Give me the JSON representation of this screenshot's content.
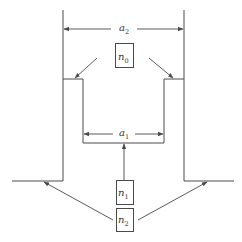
{
  "diagram": {
    "type": "cross-section schematic",
    "colors": {
      "stroke": "#4a4a4a",
      "arrow": "#5a5a5a",
      "background": "#ffffff"
    },
    "dimensions": {
      "a2": {
        "label": "a",
        "subscript": "2",
        "description": "outer width"
      },
      "a1": {
        "label": "a",
        "subscript": "1",
        "description": "inner width"
      }
    },
    "labels": {
      "n0": {
        "label": "n",
        "subscript": "0"
      },
      "n1": {
        "label": "n",
        "subscript": "1"
      },
      "n2": {
        "label": "n",
        "subscript": "2"
      }
    }
  }
}
